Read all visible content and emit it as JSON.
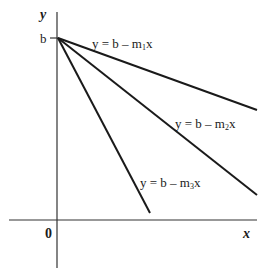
{
  "diagram": {
    "type": "linear-functions",
    "axes": {
      "x_label": "x",
      "y_label": "y",
      "origin_label": "0",
      "y_intercept_label": "b"
    },
    "lines": [
      {
        "id": "line-1",
        "prefix": "y = b – m",
        "subscript": "1",
        "suffix": "x",
        "slope_rank": "shallow"
      },
      {
        "id": "line-2",
        "prefix": "y = b – m",
        "subscript": "2",
        "suffix": "x",
        "slope_rank": "medium"
      },
      {
        "id": "line-3",
        "prefix": "y = b – m",
        "subscript": "3",
        "suffix": "x",
        "slope_rank": "steep"
      }
    ],
    "colors": {
      "line": "#1a1a1a",
      "axis": "#333333",
      "background": "#ffffff"
    }
  }
}
